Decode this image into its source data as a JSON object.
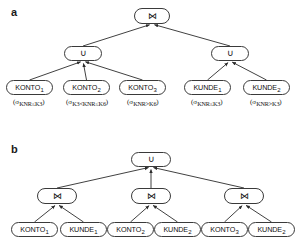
{
  "figure": {
    "type": "query-tree-diagram",
    "background": "#ffffff",
    "stroke_color": "#3a3a3a",
    "text_color": "#111111",
    "panels": [
      {
        "id": "a",
        "label": "a",
        "nodes": [
          {
            "id": "a-join-root",
            "kind": "operator",
            "symbol": "⋈",
            "icon": "join-icon",
            "x": 134,
            "y": 8,
            "w": 36,
            "h": 16
          },
          {
            "id": "a-union-left",
            "kind": "operator",
            "symbol": "∪",
            "icon": "union-icon",
            "x": 64,
            "y": 46,
            "w": 38,
            "h": 15
          },
          {
            "id": "a-union-right",
            "kind": "operator",
            "symbol": "∪",
            "icon": "union-icon",
            "x": 211,
            "y": 46,
            "w": 38,
            "h": 15
          },
          {
            "id": "a-konto-1",
            "kind": "relation",
            "name": "KONTO",
            "index": "1",
            "x": 6,
            "y": 80,
            "w": 47,
            "h": 15
          },
          {
            "id": "a-konto-2",
            "kind": "relation",
            "name": "KONTO",
            "index": "2",
            "x": 63,
            "y": 80,
            "w": 47,
            "h": 15
          },
          {
            "id": "a-konto-3",
            "kind": "relation",
            "name": "KONTO",
            "index": "3",
            "x": 119,
            "y": 80,
            "w": 47,
            "h": 15
          },
          {
            "id": "a-kunde-1",
            "kind": "relation",
            "name": "KUNDE",
            "index": "1",
            "x": 184,
            "y": 80,
            "w": 47,
            "h": 15
          },
          {
            "id": "a-kunde-2",
            "kind": "relation",
            "name": "KUNDE",
            "index": "2",
            "x": 243,
            "y": 80,
            "w": 47,
            "h": 15
          }
        ],
        "predicates": [
          {
            "id": "a-pred-1",
            "for": "a-konto-1",
            "open": "(",
            "sigma": "σ",
            "condition": "KNR≤K3",
            "close": ")",
            "cx": 29,
            "y": 99
          },
          {
            "id": "a-pred-2",
            "for": "a-konto-2",
            "open": "(",
            "sigma": "σ",
            "condition": "K3<KNR≤K6",
            "close": ")",
            "cx": 87,
            "y": 99
          },
          {
            "id": "a-pred-3",
            "for": "a-konto-3",
            "open": "(",
            "sigma": "σ",
            "condition": "KNR>K6",
            "close": ")",
            "cx": 143,
            "y": 99
          },
          {
            "id": "a-pred-4",
            "for": "a-kunde-1",
            "open": "(",
            "sigma": "σ",
            "condition": "KNR≤K3",
            "close": ")",
            "cx": 207,
            "y": 99
          },
          {
            "id": "a-pred-5",
            "for": "a-kunde-2",
            "open": "(",
            "sigma": "σ",
            "condition": "KNR>K3",
            "close": ")",
            "cx": 266,
            "y": 99
          }
        ],
        "edges": [
          {
            "from": "a-union-left",
            "to": "a-join-root"
          },
          {
            "from": "a-union-right",
            "to": "a-join-root"
          },
          {
            "from": "a-konto-1",
            "to": "a-union-left"
          },
          {
            "from": "a-konto-2",
            "to": "a-union-left"
          },
          {
            "from": "a-konto-3",
            "to": "a-union-left"
          },
          {
            "from": "a-kunde-1",
            "to": "a-union-right"
          },
          {
            "from": "a-kunde-2",
            "to": "a-union-right"
          }
        ]
      },
      {
        "id": "b",
        "label": "b",
        "nodes": [
          {
            "id": "b-union-root",
            "kind": "operator",
            "symbol": "∪",
            "icon": "union-icon",
            "x": 131,
            "y": 152,
            "w": 40,
            "h": 15
          },
          {
            "id": "b-join-1",
            "kind": "operator",
            "symbol": "⋈",
            "icon": "join-icon",
            "x": 37,
            "y": 188,
            "w": 40,
            "h": 16
          },
          {
            "id": "b-join-2",
            "kind": "operator",
            "symbol": "⋈",
            "icon": "join-icon",
            "x": 131,
            "y": 188,
            "w": 40,
            "h": 16
          },
          {
            "id": "b-join-3",
            "kind": "operator",
            "symbol": "⋈",
            "icon": "join-icon",
            "x": 224,
            "y": 188,
            "w": 40,
            "h": 16
          },
          {
            "id": "b-konto-1",
            "kind": "relation",
            "name": "KONTO",
            "index": "1",
            "x": 11,
            "y": 222,
            "w": 47,
            "h": 15
          },
          {
            "id": "b-kunde-1",
            "kind": "relation",
            "name": "KUNDE",
            "index": "1",
            "x": 60,
            "y": 222,
            "w": 47,
            "h": 15
          },
          {
            "id": "b-konto-2",
            "kind": "relation",
            "name": "KONTO",
            "index": "2",
            "x": 107,
            "y": 222,
            "w": 47,
            "h": 15
          },
          {
            "id": "b-kunde-2",
            "kind": "relation",
            "name": "KUNDE",
            "index": "2",
            "x": 154,
            "y": 222,
            "w": 47,
            "h": 15
          },
          {
            "id": "b-konto-3",
            "kind": "relation",
            "name": "KONTO",
            "index": "3",
            "x": 201,
            "y": 222,
            "w": 47,
            "h": 15
          },
          {
            "id": "b-kunde-2b",
            "kind": "relation",
            "name": "KUNDE",
            "index": "2",
            "x": 248,
            "y": 222,
            "w": 47,
            "h": 15
          }
        ],
        "predicates": [],
        "edges": [
          {
            "from": "b-join-1",
            "to": "b-union-root"
          },
          {
            "from": "b-join-2",
            "to": "b-union-root"
          },
          {
            "from": "b-join-3",
            "to": "b-union-root"
          },
          {
            "from": "b-konto-1",
            "to": "b-join-1"
          },
          {
            "from": "b-kunde-1",
            "to": "b-join-1"
          },
          {
            "from": "b-konto-2",
            "to": "b-join-2"
          },
          {
            "from": "b-kunde-2",
            "to": "b-join-2"
          },
          {
            "from": "b-konto-3",
            "to": "b-join-3"
          },
          {
            "from": "b-kunde-2b",
            "to": "b-join-3"
          }
        ]
      }
    ]
  }
}
